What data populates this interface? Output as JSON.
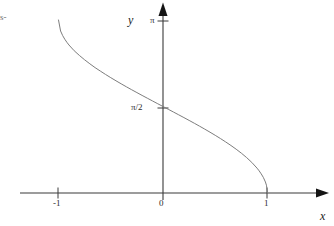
{
  "figure": {
    "background_color": "#ffffff",
    "width": 334,
    "height": 226,
    "axis_color": "#3a3a3a",
    "curve_color": "#7d7d7d"
  },
  "labels": {
    "x_axis": "x",
    "y_axis": "y",
    "corner_fragment": "s-"
  },
  "ticks": {
    "x": [
      {
        "label": "-1",
        "value": -1
      },
      {
        "label": "0",
        "value": 0
      },
      {
        "label": "1",
        "value": 1
      }
    ],
    "y": [
      {
        "label": "π/2",
        "value": 1.5707963
      },
      {
        "label": "π",
        "value": 3.1415927
      }
    ]
  },
  "chart_data": {
    "type": "line",
    "title": "",
    "xlabel": "x",
    "ylabel": "y",
    "grid": false,
    "legend": null,
    "xlim": [
      -1.35,
      1.55
    ],
    "ylim": [
      -0.15,
      3.55
    ],
    "xticks": [
      -1,
      0,
      1
    ],
    "xticklabels": [
      "-1",
      "0",
      "1"
    ],
    "yticks": [
      1.5707963,
      3.1415927
    ],
    "yticklabels": [
      "π/2",
      "π"
    ],
    "series": [
      {
        "name": "arccos(x)",
        "color": "#7d7d7d",
        "x": [
          -1.0,
          -0.98,
          -0.96,
          -0.94,
          -0.92,
          -0.9,
          -0.85,
          -0.8,
          -0.75,
          -0.7,
          -0.65,
          -0.6,
          -0.55,
          -0.5,
          -0.45,
          -0.4,
          -0.35,
          -0.3,
          -0.25,
          -0.2,
          -0.15,
          -0.1,
          -0.05,
          0.0,
          0.05,
          0.1,
          0.15,
          0.2,
          0.25,
          0.3,
          0.35,
          0.4,
          0.45,
          0.5,
          0.55,
          0.6,
          0.65,
          0.7,
          0.75,
          0.8,
          0.85,
          0.9,
          0.92,
          0.94,
          0.96,
          0.98,
          0.99,
          1.0
        ],
        "y": [
          3.1416,
          2.9416,
          2.8579,
          2.7927,
          2.7372,
          2.688,
          2.5839,
          2.4981,
          2.4189,
          2.3462,
          2.277,
          2.2143,
          2.1531,
          2.0944,
          2.0377,
          1.9823,
          1.9282,
          1.8755,
          1.8235,
          1.7722,
          1.7215,
          1.671,
          1.6208,
          1.5708,
          1.5208,
          1.4706,
          1.4201,
          1.3694,
          1.3181,
          1.2661,
          1.2134,
          1.1593,
          1.1039,
          1.0472,
          0.9884,
          0.9273,
          0.8632,
          0.7954,
          0.7227,
          0.6435,
          0.5548,
          0.451,
          0.4027,
          0.3469,
          0.2838,
          0.2003,
          0.1415,
          0.0
        ]
      }
    ],
    "annotations": []
  }
}
